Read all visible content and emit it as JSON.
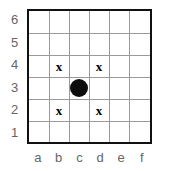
{
  "figure": {
    "type": "chessboard-grid"
  },
  "board": {
    "files": [
      "a",
      "b",
      "c",
      "d",
      "e",
      "f"
    ],
    "ranks": [
      "6",
      "5",
      "4",
      "3",
      "2",
      "1"
    ],
    "columns": 6,
    "rows": 6
  },
  "colors": {
    "background": "#ffffff",
    "border": "#111111",
    "gridline": "#9a9a9a",
    "label": "#656565",
    "piece": "#0d0d0d",
    "mark": "#000000"
  },
  "pieces": [
    {
      "square": "c3",
      "file": "c",
      "rank": "3",
      "glyph": "dot",
      "label": ""
    }
  ],
  "marks": [
    {
      "square": "b4",
      "file": "b",
      "rank": "4",
      "glyph": "x",
      "label": "x"
    },
    {
      "square": "d4",
      "file": "d",
      "rank": "4",
      "glyph": "x",
      "label": "x"
    },
    {
      "square": "b2",
      "file": "b",
      "rank": "2",
      "glyph": "x",
      "label": "x"
    },
    {
      "square": "d2",
      "file": "d",
      "rank": "2",
      "glyph": "x",
      "label": "x"
    }
  ]
}
